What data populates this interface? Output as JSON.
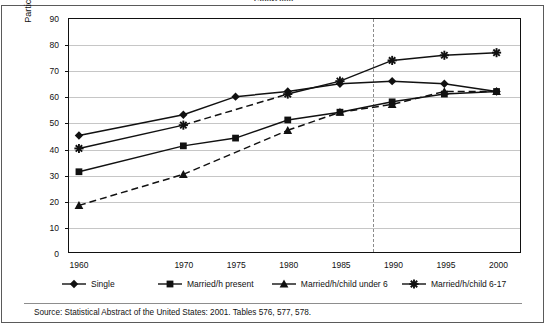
{
  "chart_data": {
    "type": "line",
    "title": "1960-2000",
    "xlabel": "",
    "ylabel": "Participation rate",
    "categories": [
      "1960",
      "1970",
      "1975",
      "1980",
      "1985",
      "1990",
      "1995",
      "2000"
    ],
    "ylim": [
      0,
      90
    ],
    "ytick_labels": [
      "0",
      "10",
      "20",
      "30",
      "40",
      "50",
      "60",
      "70",
      "80",
      "90"
    ],
    "grid": true,
    "legend_position": "bottom",
    "annotations": [
      {
        "kind": "vertical-dashed-line",
        "x_value": 1988,
        "label": ""
      }
    ],
    "series": [
      {
        "name": "Single",
        "marker": "diamond",
        "linestyle": "solid",
        "values": [
          45,
          53,
          60,
          62,
          65,
          66,
          65,
          62
        ]
      },
      {
        "name": "Married/h present",
        "marker": "square",
        "linestyle": "solid",
        "values": [
          31,
          41,
          44,
          51,
          54,
          58,
          61,
          62
        ]
      },
      {
        "name": "Married/h/child under 6",
        "marker": "triangle",
        "linestyle": "dashed",
        "values": [
          18,
          30,
          null,
          47,
          54,
          57,
          62,
          62
        ]
      },
      {
        "name": "Married/h/child 6-17",
        "marker": "asterisk",
        "linestyle": "solid",
        "values": [
          40,
          49,
          null,
          61,
          66,
          74,
          76,
          77
        ]
      }
    ],
    "source": "Source: Statistical Abstract of the United States: 2001. Tables 576, 577, 578."
  }
}
